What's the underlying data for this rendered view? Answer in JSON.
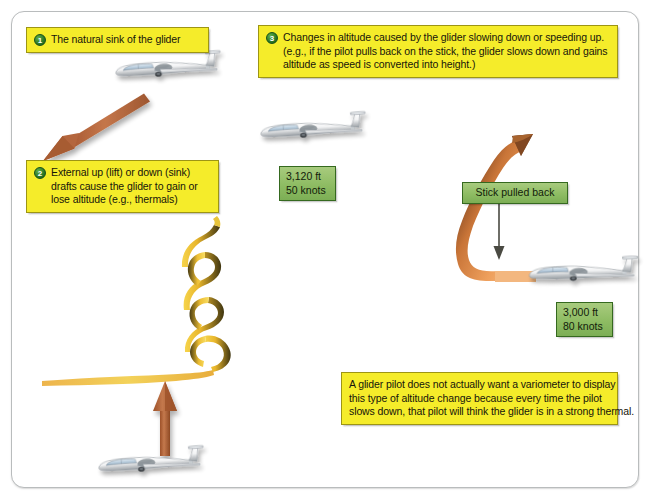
{
  "diagram": {
    "frame_color": "#b9bcbd",
    "callout_fill": "#f5ec2a",
    "callout_border": "#9d9514",
    "greenbox_fill": "#8ebc63",
    "greenbox_border": "#35691f",
    "arrow_brown": "#b0623a",
    "thermal_yellow": "#f2c52e"
  },
  "callouts": [
    {
      "id": "callout-1",
      "number": "1",
      "lines": [
        "The natural sink of the glider"
      ]
    },
    {
      "id": "callout-2",
      "number": "2",
      "lines": [
        "External up (lift) or down (sink)",
        "drafts cause the glider to gain or",
        "lose altitude (e.g., thermals)"
      ]
    },
    {
      "id": "callout-3",
      "number": "3",
      "lines": [
        "Changes in altitude caused by the glider slowing down or speeding up.",
        "(e.g., if the pilot pulls back on the stick, the glider slows down and gains",
        "altitude as speed is converted into height.)"
      ]
    },
    {
      "id": "callout-note",
      "number": "",
      "lines": [
        "A glider pilot does not actually want a variometer to display",
        "this type of altitude change because every time the pilot",
        "slows down, that pilot will think the glider is in a strong thermal."
      ]
    }
  ],
  "green_boxes": [
    {
      "id": "readout-upper",
      "lines": [
        "3,120 ft",
        "50 knots"
      ]
    },
    {
      "id": "readout-lower",
      "lines": [
        "3,000 ft",
        "80 knots"
      ]
    },
    {
      "id": "stick-label",
      "lines": [
        "Stick pulled back"
      ]
    }
  ],
  "icons": {
    "glider_sink": "glider-icon",
    "glider_thermal": "glider-icon",
    "glider_slow": "glider-icon",
    "glider_fast": "glider-icon",
    "sink_arrow": "down-left-arrow-icon",
    "lift_arrow": "up-arrow-icon",
    "zoom_arrow": "curved-climb-arrow-icon",
    "stick_arrow": "down-arrow-icon",
    "thermal": "thermal-ribbon-icon"
  }
}
